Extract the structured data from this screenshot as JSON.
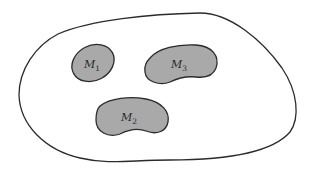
{
  "diagram": {
    "colors": {
      "background": "#ffffff",
      "outline": "#2b2b2b",
      "region_fill": "#a9a9a9"
    },
    "outer_region": {
      "label": ""
    },
    "regions": [
      {
        "id": "M1",
        "symbol": "M",
        "subscript": "1"
      },
      {
        "id": "M3",
        "symbol": "M",
        "subscript": "3"
      },
      {
        "id": "M2",
        "symbol": "M",
        "subscript": "2"
      }
    ]
  }
}
